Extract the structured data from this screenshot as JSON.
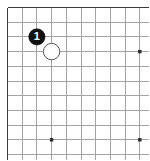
{
  "diagram": {
    "type": "go-board-diagram",
    "board_size": 19,
    "view": {
      "width": 149,
      "height": 160,
      "cropped_corner": "top-left",
      "visible_columns": 11,
      "visible_rows": 11,
      "grid_spacing": 14.7,
      "origin_x": 7.5,
      "origin_y": 7.5,
      "edge_line_width": 1.8,
      "inner_line_width": 0.9
    },
    "colors": {
      "background": "#ffffff",
      "edge_line": "#3a3a3a",
      "inner_line": "#9a9a9a",
      "black_stone_fill": "#111111",
      "black_stone_label": "#ffffff",
      "white_stone_fill": "#ffffff",
      "white_stone_outline": "#555555",
      "star_point": "#2b2b2b"
    },
    "star_points": [
      {
        "name": "star-point-upper-right",
        "col": 9,
        "row": 3
      },
      {
        "name": "star-point-lower-left",
        "col": 3,
        "row": 9
      },
      {
        "name": "star-point-lower-right",
        "col": 9,
        "row": 9
      }
    ],
    "stones": [
      {
        "name": "black-stone-move-1",
        "color": "black",
        "label": "1",
        "col": 2,
        "row": 2,
        "radius": 8.2
      },
      {
        "name": "white-stone",
        "color": "white",
        "label": "",
        "col": 3,
        "row": 3,
        "radius": 8.2
      }
    ]
  }
}
